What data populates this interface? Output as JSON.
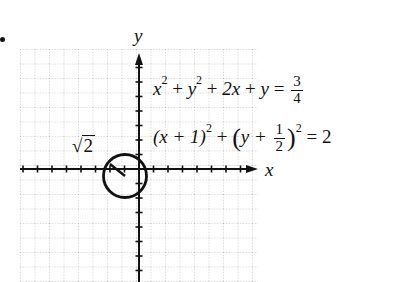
{
  "figure": {
    "bullet": "•",
    "axes": {
      "x_label": "x",
      "y_label": "y",
      "unit_px": 14.5,
      "origin_px": [
        139,
        169
      ],
      "grid": {
        "left": 20,
        "top": 49,
        "right": 258,
        "bottom": 282,
        "minor_per_unit": 1
      }
    },
    "circle": {
      "center": [
        -1,
        -0.5
      ],
      "radius_value": "√2",
      "radius_label_text": "2",
      "radius_label_prefix": "√",
      "radius_px": 22
    },
    "equation_1": {
      "lhs_terms": [
        "x",
        "2",
        "+",
        "y",
        "2",
        "+",
        "2x",
        "+",
        "y",
        "="
      ],
      "rhs_num": "3",
      "rhs_den": "4"
    },
    "equation_2": {
      "part_a": "(x + 1)",
      "exp_a": "2",
      "plus": "+",
      "open_paren": "(",
      "y_plus": "y +",
      "frac_num": "1",
      "frac_den": "2",
      "close_paren": ")",
      "exp_b": "2",
      "equals": "= 2"
    },
    "colors": {
      "ink": "#111111",
      "grid": "#9a9a9a",
      "background": "#ffffff"
    }
  }
}
